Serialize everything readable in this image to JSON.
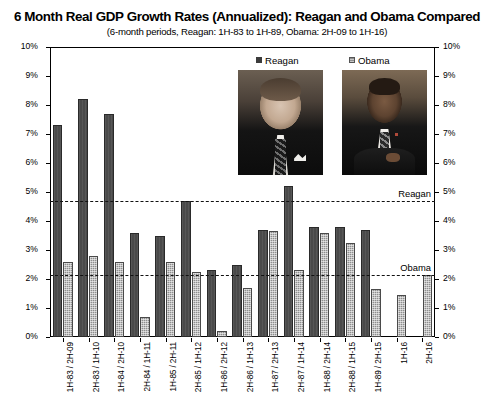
{
  "chart_data": {
    "type": "bar",
    "title": "6 Month Real GDP Growth Rates (Annualized): Reagan and Obama Compared",
    "subtitle": "(6-month periods, Reagan: 1H-83 to 1H-89, Obama: 2H-09 to 1H-16)",
    "xlabel": "",
    "ylabel": "",
    "ylim": [
      0,
      10
    ],
    "ytick_labels": [
      "10%",
      "9%",
      "8%",
      "7%",
      "6%",
      "5%",
      "4%",
      "3%",
      "2%",
      "1%",
      "0%"
    ],
    "ytick_values": [
      10,
      9,
      8,
      7,
      6,
      5,
      4,
      3,
      2,
      1,
      0
    ],
    "grid": false,
    "legend_position": "top-center",
    "categories": [
      "1H-83 / 2H-09",
      "2H-83 / 1H-10",
      "1H-84 / 2H-10",
      "2H-84 / 1H-11",
      "1H-85 / 2H-11",
      "2H-85 / 1H-12",
      "1H-86 / 2H-12",
      "2H-86 / 1H-13",
      "1H-87 / 2H-13",
      "2H-87 / 1H-14",
      "1H-88 / 2H-14",
      "2H-88 / 1H-15",
      "1H-89 / 2H-15",
      "1H-16",
      "2H-16"
    ],
    "series": [
      {
        "name": "Reagan",
        "color": "#4a4a4a",
        "values": [
          7.3,
          8.2,
          7.7,
          3.6,
          3.5,
          4.7,
          2.3,
          2.5,
          3.7,
          5.2,
          3.8,
          3.8,
          3.7,
          null,
          null
        ]
      },
      {
        "name": "Obama",
        "color": "#8e8e8e",
        "values": [
          2.6,
          2.8,
          2.6,
          0.7,
          2.6,
          2.25,
          0.2,
          1.7,
          3.65,
          2.3,
          3.6,
          3.25,
          1.65,
          1.45,
          2.15
        ]
      }
    ],
    "reference_lines": [
      {
        "label": "Reagan",
        "value": 4.7
      },
      {
        "label": "Obama",
        "value": 2.15
      }
    ],
    "annotations": [
      {
        "name": "reagan-portrait",
        "caption": "Reagan"
      },
      {
        "name": "obama-portrait",
        "caption": "Obama"
      }
    ]
  }
}
